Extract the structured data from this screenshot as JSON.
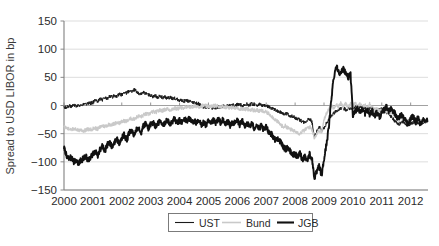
{
  "chart_data": {
    "type": "line",
    "title": "",
    "xlabel": "",
    "ylabel": "Spread to USD LIBOR in bp",
    "xlim": [
      2000.0,
      2012.6
    ],
    "ylim": [
      -150,
      150
    ],
    "yticks": [
      150,
      100,
      50,
      0,
      -50,
      -100,
      -150
    ],
    "ytick_labels": [
      "150",
      "100",
      "50",
      "0",
      "−50",
      "−100",
      "−150"
    ],
    "xticks": [
      2000,
      2001,
      2002,
      2003,
      2004,
      2005,
      2006,
      2007,
      2008,
      2009,
      2010,
      2011,
      2012
    ],
    "xtick_labels": [
      "2000",
      "2001",
      "2002",
      "2003",
      "2004",
      "2005",
      "2006",
      "2007",
      "2008",
      "2009",
      "2010",
      "2011",
      "2012"
    ],
    "grid": "horizontal",
    "legend_position": "bottom-center",
    "legend": [
      {
        "name": "UST",
        "color": "#1a1a1a",
        "width": 1.0
      },
      {
        "name": "Bund",
        "color": "#c9c9c9",
        "width": 1.3
      },
      {
        "name": "JGB",
        "color": "#111111",
        "width": 1.9
      }
    ],
    "series": [
      {
        "name": "UST",
        "color": "#1a1a1a",
        "width": 1.0,
        "x": [
          2000.0,
          2000.08,
          2000.17,
          2000.25,
          2000.33,
          2000.42,
          2000.5,
          2000.58,
          2000.67,
          2000.75,
          2000.83,
          2000.92,
          2001.0,
          2001.08,
          2001.17,
          2001.25,
          2001.33,
          2001.42,
          2001.5,
          2001.58,
          2001.67,
          2001.75,
          2001.83,
          2001.92,
          2002.0,
          2002.08,
          2002.17,
          2002.25,
          2002.33,
          2002.42,
          2002.5,
          2002.58,
          2002.67,
          2002.75,
          2002.83,
          2002.92,
          2003.0,
          2003.08,
          2003.17,
          2003.25,
          2003.33,
          2003.42,
          2003.5,
          2003.58,
          2003.67,
          2003.75,
          2003.83,
          2003.92,
          2004.0,
          2004.08,
          2004.17,
          2004.25,
          2004.33,
          2004.42,
          2004.5,
          2004.58,
          2004.67,
          2004.75,
          2004.83,
          2004.92,
          2005.0,
          2005.08,
          2005.17,
          2005.25,
          2005.33,
          2005.42,
          2005.5,
          2005.58,
          2005.67,
          2005.75,
          2005.83,
          2005.92,
          2006.0,
          2006.08,
          2006.17,
          2006.25,
          2006.33,
          2006.42,
          2006.5,
          2006.58,
          2006.67,
          2006.75,
          2006.83,
          2006.92,
          2007.0,
          2007.08,
          2007.17,
          2007.25,
          2007.33,
          2007.42,
          2007.5,
          2007.58,
          2007.67,
          2007.75,
          2007.83,
          2007.92,
          2008.0,
          2008.08,
          2008.17,
          2008.25,
          2008.33,
          2008.42,
          2008.5,
          2008.58,
          2008.67,
          2008.75,
          2008.83,
          2008.92,
          2009.0,
          2009.08,
          2009.17,
          2009.25,
          2009.33,
          2009.42,
          2009.5,
          2009.58,
          2009.67,
          2009.75,
          2009.83,
          2009.92,
          2010.0,
          2010.08,
          2010.17,
          2010.25,
          2010.33,
          2010.42,
          2010.5,
          2010.58,
          2010.67,
          2010.75,
          2010.83,
          2010.92,
          2011.0,
          2011.08,
          2011.17,
          2011.25,
          2011.33,
          2011.42,
          2011.5,
          2011.58,
          2011.67,
          2011.75,
          2011.83,
          2011.92,
          2012.0,
          2012.08,
          2012.17,
          2012.25,
          2012.33,
          2012.45,
          2012.58
        ],
        "values": [
          -2,
          -4,
          0,
          -3,
          1,
          -1,
          2,
          0,
          3,
          2,
          5,
          4,
          6,
          9,
          8,
          12,
          10,
          14,
          12,
          16,
          15,
          18,
          17,
          20,
          19,
          23,
          22,
          26,
          24,
          28,
          25,
          22,
          20,
          23,
          21,
          19,
          18,
          16,
          17,
          15,
          16,
          14,
          15,
          13,
          14,
          12,
          13,
          11,
          10,
          9,
          8,
          9,
          7,
          6,
          5,
          4,
          3,
          -1,
          -3,
          -2,
          -4,
          -3,
          -5,
          -4,
          -2,
          -3,
          -1,
          -2,
          0,
          -1,
          1,
          0,
          1,
          2,
          0,
          1,
          2,
          1,
          3,
          2,
          1,
          2,
          0,
          1,
          -1,
          -2,
          -4,
          -6,
          -8,
          -10,
          -12,
          -15,
          -14,
          -16,
          -18,
          -20,
          -22,
          -24,
          -26,
          -28,
          -30,
          -26,
          -24,
          -28,
          -55,
          -46,
          -38,
          -45,
          -40,
          -32,
          -24,
          -18,
          -14,
          -10,
          -8,
          -6,
          -5,
          -7,
          -6,
          -4,
          -5,
          -3,
          -4,
          -2,
          -3,
          -5,
          -4,
          -6,
          -5,
          -7,
          -6,
          -8,
          -7,
          -9,
          -12,
          -16,
          -20,
          -26,
          -30,
          -34,
          -30,
          -28,
          -32,
          -36,
          -32,
          -30,
          -34,
          -30,
          -33,
          -29,
          -27
        ]
      },
      {
        "name": "Bund",
        "color": "#c9c9c9",
        "width": 1.3,
        "x": [
          2000.0,
          2000.08,
          2000.17,
          2000.25,
          2000.33,
          2000.42,
          2000.5,
          2000.58,
          2000.67,
          2000.75,
          2000.83,
          2000.92,
          2001.0,
          2001.08,
          2001.17,
          2001.25,
          2001.33,
          2001.42,
          2001.5,
          2001.58,
          2001.67,
          2001.75,
          2001.83,
          2001.92,
          2002.0,
          2002.08,
          2002.17,
          2002.25,
          2002.33,
          2002.42,
          2002.5,
          2002.58,
          2002.67,
          2002.75,
          2002.83,
          2002.92,
          2003.0,
          2003.08,
          2003.17,
          2003.25,
          2003.33,
          2003.42,
          2003.5,
          2003.58,
          2003.67,
          2003.75,
          2003.83,
          2003.92,
          2004.0,
          2004.08,
          2004.17,
          2004.25,
          2004.33,
          2004.42,
          2004.5,
          2004.58,
          2004.67,
          2004.75,
          2004.83,
          2004.92,
          2005.0,
          2005.08,
          2005.17,
          2005.25,
          2005.33,
          2005.42,
          2005.5,
          2005.58,
          2005.67,
          2005.75,
          2005.83,
          2005.92,
          2006.0,
          2006.08,
          2006.17,
          2006.25,
          2006.33,
          2006.42,
          2006.5,
          2006.58,
          2006.67,
          2006.75,
          2006.83,
          2006.92,
          2007.0,
          2007.08,
          2007.17,
          2007.25,
          2007.33,
          2007.42,
          2007.5,
          2007.58,
          2007.67,
          2007.75,
          2007.83,
          2007.92,
          2008.0,
          2008.08,
          2008.17,
          2008.25,
          2008.33,
          2008.42,
          2008.5,
          2008.58,
          2008.67,
          2008.75,
          2008.83,
          2008.92,
          2009.0,
          2009.08,
          2009.17,
          2009.25,
          2009.33,
          2009.42,
          2009.5,
          2009.58,
          2009.67,
          2009.75,
          2009.83,
          2009.92,
          2010.0,
          2010.08,
          2010.17,
          2010.25,
          2010.33,
          2010.42,
          2010.5,
          2010.58,
          2010.67,
          2010.75,
          2010.83,
          2010.92,
          2011.0,
          2011.08,
          2011.17,
          2011.25,
          2011.33,
          2011.42,
          2011.5,
          2011.58,
          2011.67,
          2011.75,
          2011.83,
          2011.92,
          2012.0,
          2012.08,
          2012.17,
          2012.25,
          2012.33,
          2012.45,
          2012.58
        ],
        "values": [
          -38,
          -40,
          -42,
          -41,
          -43,
          -42,
          -44,
          -43,
          -45,
          -44,
          -42,
          -43,
          -41,
          -40,
          -42,
          -38,
          -36,
          -37,
          -35,
          -33,
          -34,
          -32,
          -30,
          -31,
          -29,
          -27,
          -28,
          -25,
          -23,
          -24,
          -21,
          -19,
          -20,
          -17,
          -15,
          -16,
          -13,
          -11,
          -12,
          -10,
          -8,
          -9,
          -7,
          -6,
          -8,
          -6,
          -5,
          -6,
          -4,
          -5,
          -3,
          -4,
          -2,
          -3,
          -2,
          -1,
          -2,
          -1,
          0,
          -1,
          -1,
          -2,
          -1,
          0,
          -1,
          -2,
          -1,
          -3,
          -2,
          -4,
          -3,
          -5,
          -4,
          -6,
          -5,
          -7,
          -6,
          -8,
          -7,
          -9,
          -8,
          -10,
          -9,
          -11,
          -12,
          -14,
          -18,
          -22,
          -26,
          -30,
          -34,
          -38,
          -36,
          -40,
          -42,
          -45,
          -44,
          -48,
          -50,
          -46,
          -44,
          -40,
          -38,
          -42,
          -58,
          -50,
          -44,
          -48,
          -26,
          -14,
          -6,
          0,
          -4,
          2,
          -2,
          4,
          -3,
          5,
          -4,
          3,
          -2,
          4,
          -3,
          5,
          -4,
          2,
          -5,
          3,
          -4,
          -8,
          -6,
          -10,
          -8,
          -12,
          -10,
          -14,
          -12,
          -16,
          -22,
          -26,
          -20,
          -24,
          -28,
          -32,
          -26,
          -22,
          -30,
          -24,
          -32,
          -26,
          -30
        ]
      },
      {
        "name": "JGB",
        "color": "#111111",
        "width": 1.9,
        "x": [
          2000.0,
          2000.08,
          2000.17,
          2000.25,
          2000.33,
          2000.42,
          2000.5,
          2000.58,
          2000.67,
          2000.75,
          2000.83,
          2000.92,
          2001.0,
          2001.08,
          2001.17,
          2001.25,
          2001.33,
          2001.42,
          2001.5,
          2001.58,
          2001.67,
          2001.75,
          2001.83,
          2001.92,
          2002.0,
          2002.08,
          2002.17,
          2002.25,
          2002.33,
          2002.42,
          2002.5,
          2002.58,
          2002.67,
          2002.75,
          2002.83,
          2002.92,
          2003.0,
          2003.08,
          2003.17,
          2003.25,
          2003.33,
          2003.42,
          2003.5,
          2003.58,
          2003.67,
          2003.75,
          2003.83,
          2003.92,
          2004.0,
          2004.08,
          2004.17,
          2004.25,
          2004.33,
          2004.42,
          2004.5,
          2004.58,
          2004.67,
          2004.75,
          2004.83,
          2004.92,
          2005.0,
          2005.08,
          2005.17,
          2005.25,
          2005.33,
          2005.42,
          2005.5,
          2005.58,
          2005.67,
          2005.75,
          2005.83,
          2005.92,
          2006.0,
          2006.08,
          2006.17,
          2006.25,
          2006.33,
          2006.42,
          2006.5,
          2006.58,
          2006.67,
          2006.75,
          2006.83,
          2006.92,
          2007.0,
          2007.08,
          2007.17,
          2007.25,
          2007.33,
          2007.42,
          2007.5,
          2007.58,
          2007.67,
          2007.75,
          2007.83,
          2007.92,
          2008.0,
          2008.08,
          2008.17,
          2008.25,
          2008.33,
          2008.42,
          2008.5,
          2008.58,
          2008.67,
          2008.75,
          2008.83,
          2008.92,
          2009.0,
          2009.08,
          2009.17,
          2009.25,
          2009.33,
          2009.42,
          2009.5,
          2009.58,
          2009.67,
          2009.75,
          2009.83,
          2009.92,
          2010.0,
          2010.08,
          2010.17,
          2010.25,
          2010.33,
          2010.42,
          2010.5,
          2010.58,
          2010.67,
          2010.75,
          2010.83,
          2010.92,
          2011.0,
          2011.08,
          2011.17,
          2011.25,
          2011.33,
          2011.42,
          2011.5,
          2011.58,
          2011.67,
          2011.75,
          2011.83,
          2011.92,
          2012.0,
          2012.08,
          2012.17,
          2012.25,
          2012.33,
          2012.45,
          2012.58
        ],
        "values": [
          -75,
          -88,
          -95,
          -92,
          -100,
          -96,
          -102,
          -98,
          -94,
          -90,
          -96,
          -92,
          -86,
          -82,
          -88,
          -78,
          -72,
          -80,
          -70,
          -66,
          -74,
          -64,
          -60,
          -68,
          -58,
          -52,
          -62,
          -50,
          -44,
          -54,
          -42,
          -38,
          -48,
          -36,
          -32,
          -40,
          -34,
          -30,
          -38,
          -32,
          -28,
          -36,
          -30,
          -26,
          -34,
          -28,
          -24,
          -32,
          -26,
          -30,
          -24,
          -28,
          -22,
          -30,
          -26,
          -32,
          -28,
          -34,
          -30,
          -36,
          -28,
          -34,
          -26,
          -32,
          -24,
          -30,
          -26,
          -34,
          -28,
          -36,
          -30,
          -32,
          -26,
          -34,
          -28,
          -36,
          -30,
          -38,
          -32,
          -40,
          -34,
          -42,
          -36,
          -44,
          -38,
          -46,
          -50,
          -56,
          -62,
          -58,
          -66,
          -72,
          -78,
          -74,
          -82,
          -88,
          -86,
          -92,
          -84,
          -96,
          -90,
          -98,
          -86,
          -94,
          -128,
          -118,
          -108,
          -124,
          -96,
          -70,
          -38,
          10,
          48,
          70,
          62,
          56,
          66,
          58,
          50,
          54,
          -18,
          -10,
          -4,
          -12,
          -6,
          -14,
          -8,
          -16,
          -10,
          -18,
          -12,
          -20,
          -14,
          -8,
          -2,
          -10,
          -4,
          -12,
          -18,
          -24,
          -16,
          -22,
          -28,
          -34,
          -24,
          -18,
          -30,
          -22,
          -32,
          -24,
          -28
        ]
      }
    ],
    "series_note": {
      "UST_2009_spike": null
    }
  },
  "legend": {
    "ust": "UST",
    "bund": "Bund",
    "jgb": "JGB"
  }
}
